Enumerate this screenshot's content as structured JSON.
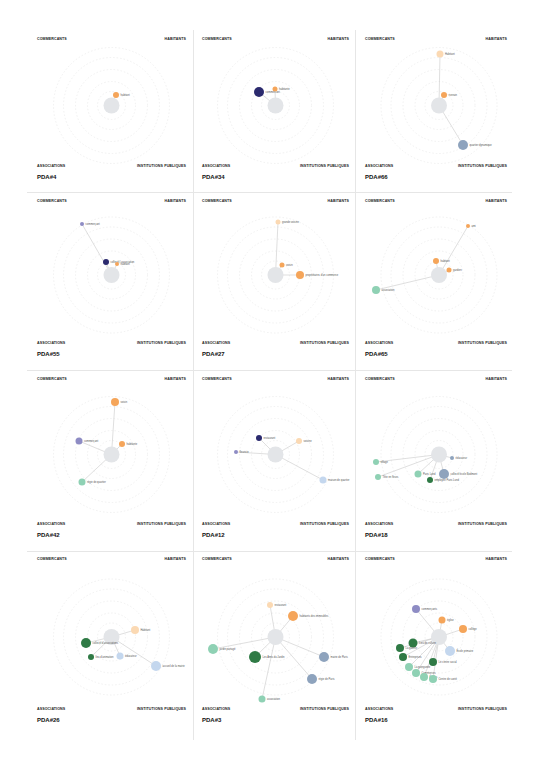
{
  "corner_labels": {
    "top_left": "COMMERCANTS",
    "top_right": "HABITANTS",
    "bottom_left": "ASSOCIATIONS",
    "bottom_right": "INSTITUTIONS PUBLIQUES"
  },
  "colors": {
    "habitant": "#f5a55a",
    "habitant_light": "#fbd9b3",
    "commercant": "#8e8cc4",
    "commercant_dark": "#2b2a6e",
    "association_light": "#8fd1b4",
    "association_dark": "#2f7a45",
    "institution": "#8ea3bd",
    "institution_light": "#c4d7ee",
    "center": "#e3e5e8",
    "ring": "#ececec"
  },
  "panels": [
    {
      "id": "PDA#4",
      "nodes": [
        {
          "label": "habitant",
          "x": 116,
          "y": 95,
          "r": 3,
          "type": "habitant"
        }
      ]
    },
    {
      "id": "PDA#34",
      "nodes": [
        {
          "label": "commercant",
          "x": 259,
          "y": 92,
          "r": 5,
          "type": "commercant_dark"
        },
        {
          "label": "habitante",
          "x": 275,
          "y": 89,
          "r": 2.5,
          "type": "habitant"
        }
      ]
    },
    {
      "id": "PDA#66",
      "nodes": [
        {
          "label": "Habitant",
          "x": 440,
          "y": 54,
          "r": 3.5,
          "type": "habitant_light"
        },
        {
          "label": "riverain",
          "x": 444,
          "y": 95,
          "r": 3,
          "type": "habitant"
        },
        {
          "label": "quartier dynamique",
          "x": 463,
          "y": 145,
          "r": 5,
          "type": "institution"
        }
      ]
    },
    {
      "id": "PDA#55",
      "nodes": [
        {
          "label": "commerçant",
          "x": 82,
          "y": 224,
          "r": 2,
          "type": "commercant"
        },
        {
          "label": "collectif / association",
          "x": 106,
          "y": 262,
          "r": 3,
          "type": "commercant_dark"
        },
        {
          "label": "habitant",
          "x": 117,
          "y": 264,
          "r": 2,
          "type": "habitant"
        }
      ]
    },
    {
      "id": "PDA#27",
      "nodes": [
        {
          "label": "grande voisine",
          "x": 278,
          "y": 222,
          "r": 2.5,
          "type": "habitant_light"
        },
        {
          "label": "voisin",
          "x": 282,
          "y": 265,
          "r": 2.5,
          "type": "habitant"
        },
        {
          "label": "propriétaires d'un commerce",
          "x": 300,
          "y": 275,
          "r": 4,
          "type": "habitant"
        }
      ]
    },
    {
      "id": "PDA#65",
      "nodes": [
        {
          "label": "ami",
          "x": 468,
          "y": 226,
          "r": 2,
          "type": "habitant"
        },
        {
          "label": "habitant",
          "x": 436,
          "y": 261,
          "r": 3,
          "type": "habitant"
        },
        {
          "label": "gardien",
          "x": 449,
          "y": 270,
          "r": 2.5,
          "type": "habitant"
        },
        {
          "label": "association",
          "x": 376,
          "y": 290,
          "r": 4,
          "type": "association_light"
        }
      ]
    },
    {
      "id": "PDA#42",
      "nodes": [
        {
          "label": "voisin",
          "x": 115,
          "y": 402,
          "r": 4,
          "type": "habitant"
        },
        {
          "label": "commerçant",
          "x": 79,
          "y": 441,
          "r": 3.5,
          "type": "commercant"
        },
        {
          "label": "habitante",
          "x": 122,
          "y": 444,
          "r": 3,
          "type": "habitant"
        },
        {
          "label": "régie de quartier",
          "x": 82,
          "y": 482,
          "r": 3.5,
          "type": "association_light"
        }
      ]
    },
    {
      "id": "PDA#12",
      "nodes": [
        {
          "label": "restaurant",
          "x": 259,
          "y": 438,
          "r": 3,
          "type": "commercant_dark"
        },
        {
          "label": "voisine",
          "x": 299,
          "y": 441,
          "r": 3,
          "type": "habitant_light"
        },
        {
          "label": "fleuriste",
          "x": 236,
          "y": 452,
          "r": 2,
          "type": "commercant"
        },
        {
          "label": "maison de quartier",
          "x": 323,
          "y": 480,
          "r": 3.5,
          "type": "institution_light"
        }
      ]
    },
    {
      "id": "PDA#18",
      "nodes": [
        {
          "label": "éducateur",
          "x": 452,
          "y": 458,
          "r": 2,
          "type": "institution"
        },
        {
          "label": "village",
          "x": 376,
          "y": 462,
          "r": 3,
          "type": "association_light"
        },
        {
          "label": "Tête en fleurs",
          "x": 378,
          "y": 477,
          "r": 3,
          "type": "association_light"
        },
        {
          "label": "Paris Lund",
          "x": 418,
          "y": 474,
          "r": 3.5,
          "type": "association_light"
        },
        {
          "label": "employée Paris Lund",
          "x": 430,
          "y": 480,
          "r": 3,
          "type": "association_dark"
        },
        {
          "label": "collectif école Bodmont",
          "x": 444,
          "y": 474,
          "r": 5,
          "type": "institution"
        }
      ]
    },
    {
      "id": "PDA#26",
      "nodes": [
        {
          "label": "Habitant",
          "x": 135,
          "y": 630,
          "r": 4,
          "type": "habitant_light"
        },
        {
          "label": "collectif d'associations",
          "x": 86,
          "y": 643,
          "r": 5,
          "type": "association_dark"
        },
        {
          "label": "lieu d'animation",
          "x": 91,
          "y": 657,
          "r": 3,
          "type": "association_dark"
        },
        {
          "label": "éducateur",
          "x": 120,
          "y": 656,
          "r": 3.5,
          "type": "institution_light"
        },
        {
          "label": "accueil de la mairie",
          "x": 156,
          "y": 666,
          "r": 5,
          "type": "institution_light"
        }
      ]
    },
    {
      "id": "PDA#3",
      "nodes": [
        {
          "label": "restaurant",
          "x": 270,
          "y": 605,
          "r": 3,
          "type": "habitant_light"
        },
        {
          "label": "habitants des immeubles",
          "x": 293,
          "y": 616,
          "r": 5,
          "type": "habitant"
        },
        {
          "label": "jardin partagé",
          "x": 213,
          "y": 649,
          "r": 5,
          "type": "association_light"
        },
        {
          "label": "Les Amis du Jardin",
          "x": 255,
          "y": 657,
          "r": 6,
          "type": "association_dark"
        },
        {
          "label": "mairie de Paris",
          "x": 324,
          "y": 657,
          "r": 5,
          "type": "institution"
        },
        {
          "label": "régie de Paris",
          "x": 312,
          "y": 679,
          "r": 5,
          "type": "institution"
        },
        {
          "label": "association",
          "x": 262,
          "y": 699,
          "r": 3.5,
          "type": "association_light"
        }
      ]
    },
    {
      "id": "PDA#16",
      "nodes": [
        {
          "label": "commerçants",
          "x": 416,
          "y": 609,
          "r": 4,
          "type": "commercant"
        },
        {
          "label": "église",
          "x": 442,
          "y": 620,
          "r": 3.5,
          "type": "habitant"
        },
        {
          "label": "collège",
          "x": 463,
          "y": 629,
          "r": 4,
          "type": "habitant"
        },
        {
          "label": "Lieu de culture",
          "x": 413,
          "y": 643,
          "r": 4.5,
          "type": "association_dark"
        },
        {
          "label": "La galerie",
          "x": 400,
          "y": 648,
          "r": 4,
          "type": "association_dark"
        },
        {
          "label": "École primaire",
          "x": 450,
          "y": 651,
          "r": 5,
          "type": "institution_light"
        },
        {
          "label": "Entreprises",
          "x": 403,
          "y": 657,
          "r": 4,
          "type": "association_dark"
        },
        {
          "label": "Le centre social",
          "x": 433,
          "y": 662,
          "r": 4,
          "type": "association_dark"
        },
        {
          "label": "La guinguette",
          "x": 409,
          "y": 667,
          "r": 4,
          "type": "association_light"
        },
        {
          "label": "Commerces",
          "x": 416,
          "y": 673,
          "r": 4,
          "type": "association_light"
        },
        {
          "label": "Écoles",
          "x": 424,
          "y": 677,
          "r": 4,
          "type": "association_light"
        },
        {
          "label": "Centre de santé",
          "x": 433,
          "y": 679,
          "r": 4,
          "type": "association_light"
        }
      ]
    }
  ]
}
